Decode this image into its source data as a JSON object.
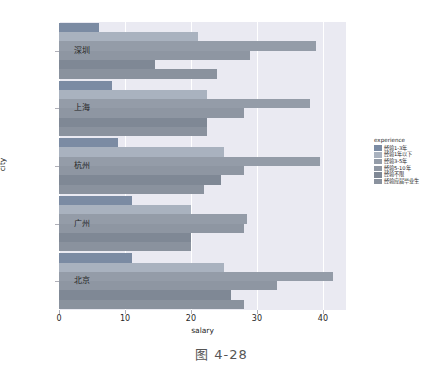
{
  "caption": "图 4-28",
  "chart_data": {
    "type": "bar",
    "orientation": "horizontal",
    "title": "",
    "xlabel": "salary",
    "ylabel": "city",
    "xlim": [
      0,
      43.5
    ],
    "xticks": [
      0,
      10,
      20,
      30,
      40
    ],
    "xtick_labels": [
      "0",
      "10",
      "20",
      "30",
      "40"
    ],
    "grid": true,
    "grid_axis": "x",
    "categories": [
      "深圳",
      "上海",
      "杭州",
      "广州",
      "北京"
    ],
    "legend": {
      "title": "experience",
      "position": "right",
      "entries": [
        {
          "label": "经验1-3年",
          "color": "#7b8ba3"
        },
        {
          "label": "经验1年以下",
          "color": "#a9b2bf"
        },
        {
          "label": "经验3-5年",
          "color": "#949ca8"
        },
        {
          "label": "经验5-10年",
          "color": "#8e96a2"
        },
        {
          "label": "经验不限",
          "color": "#7f8895"
        },
        {
          "label": "经验应届毕业生",
          "color": "#8a929e"
        }
      ]
    },
    "series": [
      {
        "name": "经验1-3年",
        "color": "#7b8ba3",
        "values": [
          6.0,
          8.0,
          9.0,
          11.0,
          11.0
        ]
      },
      {
        "name": "经验1年以下",
        "color": "#a9b2bf",
        "values": [
          21.0,
          22.5,
          25.0,
          20.0,
          25.0
        ]
      },
      {
        "name": "经验3-5年",
        "color": "#949ca8",
        "values": [
          39.0,
          38.0,
          39.5,
          28.5,
          41.5
        ]
      },
      {
        "name": "经验5-10年",
        "color": "#8e96a2",
        "values": [
          29.0,
          28.0,
          28.0,
          28.0,
          33.0
        ]
      },
      {
        "name": "经验不限",
        "color": "#7f8895",
        "values": [
          14.5,
          22.5,
          24.5,
          20.0,
          26.0
        ]
      },
      {
        "name": "经验应届毕业生",
        "color": "#8a929e",
        "values": [
          24.0,
          22.5,
          22.0,
          20.0,
          28.0
        ]
      }
    ]
  }
}
